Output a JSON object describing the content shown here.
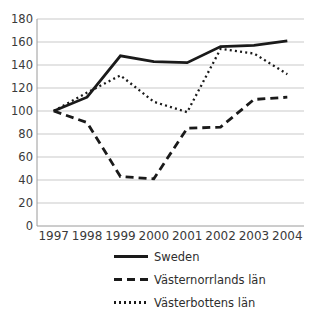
{
  "chart_data": {
    "type": "line",
    "title": "",
    "categories": [
      "1997",
      "1998",
      "1999",
      "2000",
      "2001",
      "2002",
      "2003",
      "2004"
    ],
    "series": [
      {
        "name": "Sweden",
        "line_style": "solid",
        "values": [
          100,
          112,
          148,
          143,
          142,
          156,
          157,
          161
        ]
      },
      {
        "name": "Västernorrlands län",
        "line_style": "dashed",
        "values": [
          100,
          90,
          43,
          41,
          85,
          86,
          110,
          112
        ]
      },
      {
        "name": "Västerbottens län",
        "line_style": "dotted",
        "values": [
          100,
          116,
          131,
          108,
          99,
          154,
          150,
          132
        ]
      }
    ],
    "xlabel": "",
    "ylabel": "",
    "ylim": [
      0,
      180
    ],
    "ytick_step": 20,
    "grid": true,
    "legend_position": "bottom-left",
    "colors": {
      "line": "#1a1a1a",
      "grid": "#c9c9c9",
      "axis": "#9a9a9a",
      "text": "#3a3a3a"
    }
  }
}
